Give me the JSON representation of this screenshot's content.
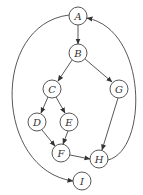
{
  "diagram": {
    "type": "directed-graph",
    "nodes": [
      {
        "id": "A",
        "label": "A",
        "x": 78,
        "y": 16
      },
      {
        "id": "B",
        "label": "B",
        "x": 78,
        "y": 53
      },
      {
        "id": "C",
        "label": "C",
        "x": 52,
        "y": 89
      },
      {
        "id": "G",
        "label": "G",
        "x": 119,
        "y": 89
      },
      {
        "id": "D",
        "label": "D",
        "x": 37,
        "y": 122
      },
      {
        "id": "E",
        "label": "E",
        "x": 69,
        "y": 122
      },
      {
        "id": "F",
        "label": "F",
        "x": 61,
        "y": 153
      },
      {
        "id": "H",
        "label": "H",
        "x": 99,
        "y": 159
      },
      {
        "id": "I",
        "label": "I",
        "x": 82,
        "y": 181
      }
    ],
    "edges": [
      {
        "from": "A",
        "to": "B"
      },
      {
        "from": "B",
        "to": "C"
      },
      {
        "from": "B",
        "to": "G"
      },
      {
        "from": "C",
        "to": "D"
      },
      {
        "from": "C",
        "to": "E"
      },
      {
        "from": "D",
        "to": "F"
      },
      {
        "from": "E",
        "to": "F"
      },
      {
        "from": "F",
        "to": "H"
      },
      {
        "from": "G",
        "to": "H"
      },
      {
        "from": "H",
        "to": "A"
      },
      {
        "from": "A",
        "to": "I"
      }
    ]
  }
}
